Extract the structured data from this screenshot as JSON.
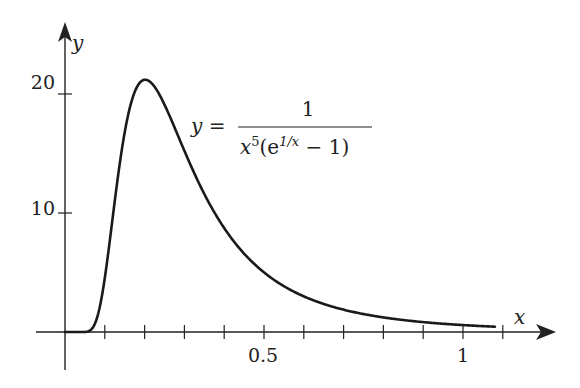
{
  "chart_data": {
    "type": "line",
    "title": "",
    "xlabel": "x",
    "ylabel": "y",
    "function": "y = 1 / (x^5 (e^(1/x) - 1))",
    "xlim": [
      0,
      1.1
    ],
    "ylim": [
      0,
      22
    ],
    "x_ticks": [
      0.1,
      0.2,
      0.3,
      0.4,
      0.5,
      0.6,
      0.7,
      0.8,
      0.9,
      1.0,
      1.1
    ],
    "x_tick_labels": [
      {
        "value": 0.5,
        "label": "0.5"
      },
      {
        "value": 1.0,
        "label": "1"
      }
    ],
    "y_ticks": [
      10,
      20
    ],
    "y_tick_labels": [
      {
        "value": 10,
        "label": "10"
      },
      {
        "value": 20,
        "label": "20"
      }
    ],
    "grid": false,
    "legend": null,
    "x_range_plotted": [
      0,
      1.08
    ],
    "series": [
      {
        "name": "y = 1/(x^5(e^{1/x} - 1))",
        "x": [
          0.0,
          0.05,
          0.08,
          0.1,
          0.12,
          0.15,
          0.18,
          0.2,
          0.22,
          0.25,
          0.3,
          0.35,
          0.4,
          0.5,
          0.6,
          0.7,
          0.8,
          0.9,
          1.0,
          1.08
        ],
        "values": [
          0.0,
          0.0,
          0.12,
          1.82,
          8.3,
          17.0,
          20.9,
          21.2,
          20.7,
          18.9,
          14.7,
          10.9,
          8.0,
          4.4,
          2.6,
          1.7,
          1.1,
          0.76,
          0.58,
          0.46
        ]
      }
    ],
    "annotations": [
      {
        "text": "y = 1 / (x^5(e^{1/x} − 1))",
        "x": 0.4,
        "y": 17.5
      }
    ],
    "peak": {
      "x": 0.2,
      "y": 21.2
    }
  },
  "labels": {
    "x_axis": "x",
    "y_axis": "y",
    "y_tick_10": "10",
    "y_tick_20": "20",
    "x_tick_05": "0.5",
    "x_tick_1": "1",
    "eq_lhs": "y =",
    "eq_num": "1",
    "eq_den_x": "x",
    "eq_den_pow5": "5",
    "eq_den_open": "(e",
    "eq_den_exp": "1/x",
    "eq_den_close": " − 1)"
  }
}
